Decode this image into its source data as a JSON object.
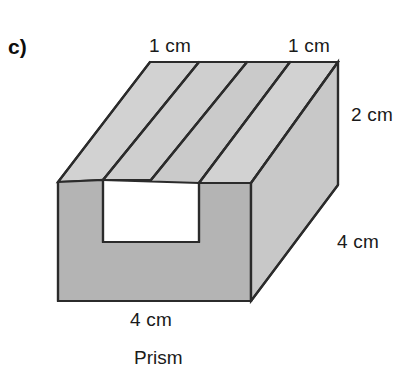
{
  "figure": {
    "part_label": "c)",
    "caption": "Prism",
    "shape_name": "rectangular prism with rectangular groove",
    "colors": {
      "top_face": "#d2d2d2",
      "front_face": "#b3b3b3",
      "side_face": "#c7c7c7",
      "groove_face": "#cfcfcf",
      "outline": "#2b2b2b",
      "text": "#1a1a1a",
      "background": "#ffffff"
    },
    "labels": [
      {
        "id": "top-left",
        "text": "1 cm",
        "edge": "back-top-left-ridge-width"
      },
      {
        "id": "top-right",
        "text": "1 cm",
        "edge": "back-top-right-ridge-width"
      },
      {
        "id": "height",
        "text": "2 cm",
        "edge": "right-vertical-height"
      },
      {
        "id": "depth",
        "text": "4 cm",
        "edge": "right-lower-depth"
      },
      {
        "id": "width",
        "text": "4 cm",
        "edge": "front-bottom-width"
      }
    ],
    "dimensions": {
      "ridge_width_left": "1 cm",
      "ridge_width_right": "1 cm",
      "height": "2 cm",
      "depth": "4 cm",
      "width": "4 cm"
    }
  }
}
